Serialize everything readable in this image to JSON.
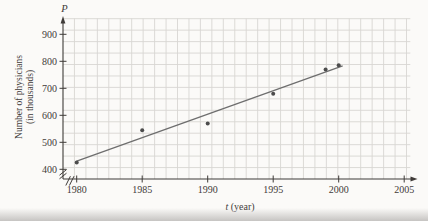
{
  "figure": {
    "background": "#fbfaf8",
    "axis_color": "#3f3b38",
    "text_color": "#3f3b38",
    "grid_color": "#d8d6d2",
    "point_color": "#4c4c4c",
    "trend_color": "#6e6e6e",
    "page_edge_color": "#c6c4c2"
  },
  "chart_data": {
    "type": "scatter",
    "title": "",
    "y_axis_letter": "P",
    "xlabel_var": "t",
    "xlabel_rest": " (year)",
    "ylabel_line1": "Number of physicians",
    "ylabel_line2": "(in thousands)",
    "x": [
      1980,
      1985,
      1990,
      1995,
      1999,
      2000
    ],
    "y": [
      425,
      545,
      570,
      680,
      770,
      785
    ],
    "x_ticks": [
      1980,
      1985,
      1990,
      1995,
      2000,
      2005
    ],
    "y_ticks": [
      400,
      500,
      600,
      700,
      800,
      900
    ],
    "xlim": [
      1980,
      2005
    ],
    "ylim": [
      400,
      900
    ],
    "grid": true,
    "legend": "none",
    "axis_breaks": {
      "x": true,
      "y": true
    },
    "trendline": {
      "x1": 1980,
      "y1": 430,
      "x2": 2000.3,
      "y2": 783
    }
  }
}
